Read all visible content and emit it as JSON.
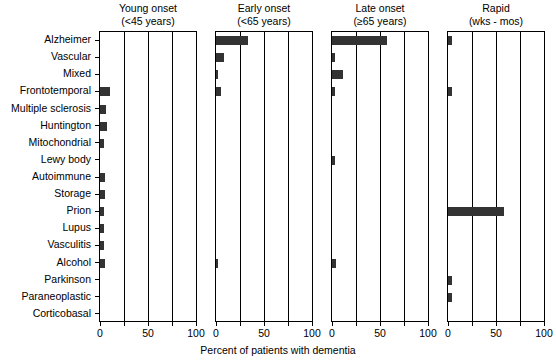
{
  "chart_data": {
    "type": "bar",
    "orientation": "horizontal",
    "title": "",
    "xlabel": "Percent of patients with dementia",
    "ylabel": "",
    "xlim": [
      0,
      100
    ],
    "xticks": [
      0,
      25,
      50,
      75,
      100
    ],
    "xticklabels": [
      "0",
      "",
      "50",
      "",
      "100"
    ],
    "grid": true,
    "grid_axis": "x",
    "legend": false,
    "bar_color": "#333333",
    "axis_color": "#000000",
    "panel_layout": "1x4 small multiples, shared y categories",
    "categories": [
      "Alzheimer",
      "Vascular",
      "Mixed",
      "Frontotemporal",
      "Multiple sclerosis",
      "Huntington",
      "Mitochondrial",
      "Lewy body",
      "Autoimmune",
      "Storage",
      "Prion",
      "Lupus",
      "Vasculitis",
      "Alcohol",
      "Parkinson",
      "Paraneoplastic",
      "Corticobasal"
    ],
    "panels": [
      {
        "id": "young-onset",
        "title_line1": "Young onset",
        "title_line2": "(<45 years)",
        "values": [
          0,
          0,
          0,
          10,
          6,
          7,
          4,
          0,
          5,
          5,
          4,
          4,
          4,
          5,
          0,
          0,
          0
        ]
      },
      {
        "id": "early-onset",
        "title_line1": "Early onset",
        "title_line2": "(<65 years)",
        "values": [
          33,
          8,
          1,
          5,
          0,
          0,
          0,
          0,
          0,
          0,
          0,
          0,
          0,
          2,
          0,
          0,
          0
        ]
      },
      {
        "id": "late-onset",
        "title_line1": "Late onset",
        "title_line2": "(≥65 years)",
        "values": [
          57,
          3,
          11,
          3,
          0,
          0,
          0,
          3,
          0,
          0,
          0,
          0,
          0,
          4,
          0,
          0,
          0
        ]
      },
      {
        "id": "rapid",
        "title_line1": "Rapid",
        "title_line2": "(wks - mos)",
        "values": [
          4,
          0,
          0,
          4,
          0,
          0,
          0,
          0,
          0,
          0,
          58,
          0,
          0,
          0,
          4,
          4,
          0
        ]
      }
    ]
  }
}
